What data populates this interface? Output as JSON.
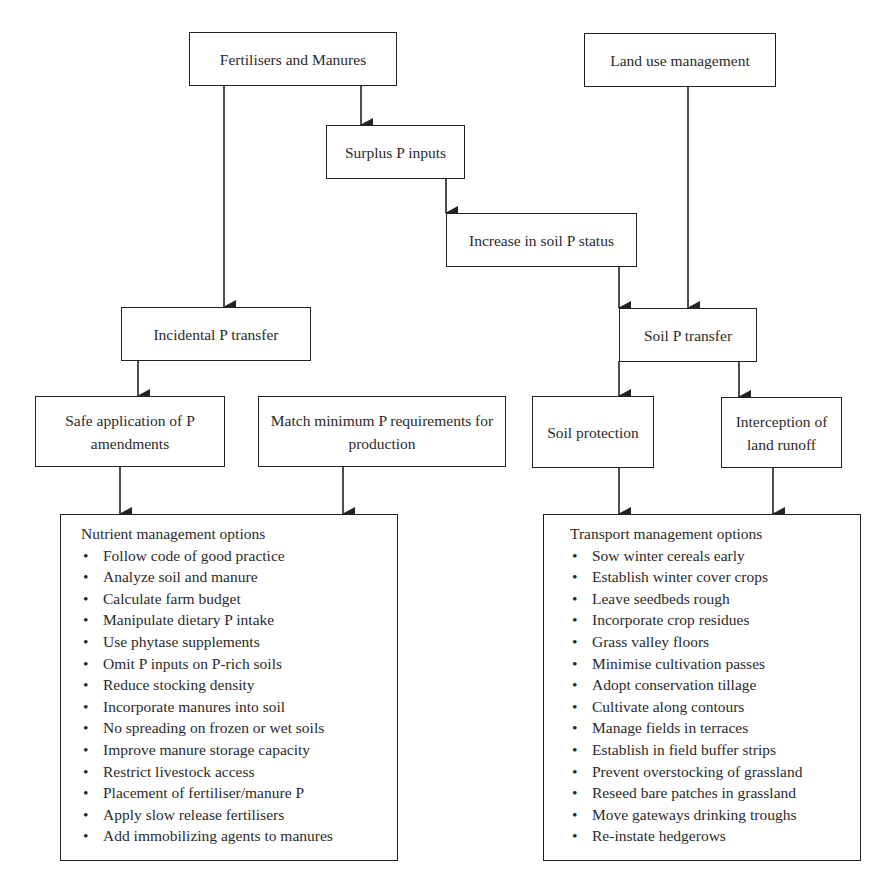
{
  "diagram": {
    "nodes": {
      "fertilisers": "Fertilisers and Manures",
      "land_use": "Land use management",
      "surplus": "Surplus P inputs",
      "increase": "Increase in soil P status",
      "incidental": "Incidental P transfer",
      "soil_transfer": "Soil P transfer",
      "safe_application": "Safe application of  P amendments",
      "match_minimum": "Match minimum P requirements for production",
      "soil_protection": "Soil protection",
      "interception": "Interception of land runoff"
    },
    "nutrient_box": {
      "title": "Nutrient management options",
      "bullet": "•",
      "items": [
        "Follow code of good practice",
        "Analyze soil and manure",
        "Calculate farm budget",
        "Manipulate dietary P intake",
        "Use phytase supplements",
        "Omit P inputs on P-rich soils",
        "Reduce stocking density",
        "Incorporate manures into soil",
        "No spreading on frozen or wet soils",
        "Improve manure storage capacity",
        "Restrict livestock access",
        "Placement of fertiliser/manure P",
        "Apply slow release fertilisers",
        "Add immobilizing agents to manures"
      ]
    },
    "transport_box": {
      "title": "Transport management options",
      "bullet": "•",
      "items": [
        "Sow winter cereals early",
        "Establish winter cover crops",
        "Leave seedbeds rough",
        "Incorporate crop residues",
        "Grass valley floors",
        "Minimise cultivation passes",
        "Adopt conservation tillage",
        "Cultivate along contours",
        "Manage fields in terraces",
        "Establish in field buffer strips",
        "Prevent overstocking of grassland",
        "Reseed bare patches in grassland",
        "Move gateways drinking troughs",
        "Re-instate hedgerows"
      ]
    },
    "colors": {
      "line": "#222222",
      "text": "#2a2a2a",
      "background": "#ffffff"
    }
  }
}
